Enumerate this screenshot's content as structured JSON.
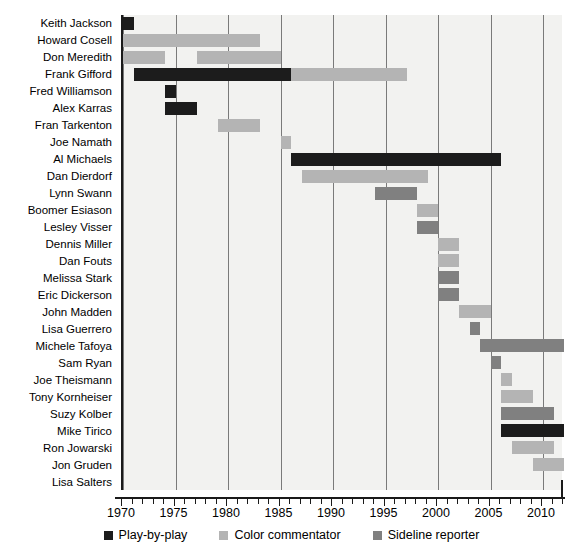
{
  "chart_data": {
    "type": "bar",
    "subtype": "gantt",
    "title": "",
    "xlabel": "",
    "ylabel": "",
    "xlim": [
      1970,
      1972
    ],
    "x_axis_range": [
      1970,
      2012
    ],
    "xticks": [
      1970,
      1975,
      1980,
      1985,
      1990,
      1995,
      2000,
      2005,
      2010
    ],
    "xtick_labels": [
      "1970",
      "1975",
      "1980",
      "1985",
      "1990",
      "1995",
      "2000",
      "2005",
      "2010"
    ],
    "minor_tick_step": 1,
    "grid": true,
    "grid_axis": "x",
    "legend_position": "bottom",
    "colors": {
      "play-by-play": "#1c1c1c",
      "color-commentator": "#b4b4b4",
      "sideline-reporter": "#808080",
      "plot_background": "#f2f2f0",
      "gridline": "#7a7a7a",
      "axis": "#1a1a1a"
    },
    "legend": [
      {
        "key": "play",
        "label": "Play-by-play",
        "color": "#1c1c1c"
      },
      {
        "key": "color",
        "label": "Color commentator",
        "color": "#b4b4b4"
      },
      {
        "key": "sideline",
        "label": "Sideline reporter",
        "color": "#808080"
      }
    ],
    "categories": [
      "Keith Jackson",
      "Howard Cosell",
      "Don Meredith",
      "Frank Gifford",
      "Fred Williamson",
      "Alex Karras",
      "Fran Tarkenton",
      "Joe Namath",
      "Al Michaels",
      "Dan Dierdorf",
      "Lynn Swann",
      "Boomer Esiason",
      "Lesley Visser",
      "Dennis Miller",
      "Dan Fouts",
      "Melissa Stark",
      "Eric Dickerson",
      "John Madden",
      "Lisa Guerrero",
      "Michele Tafoya",
      "Sam Ryan",
      "Joe Theismann",
      "Tony Kornheiser",
      "Suzy Kolber",
      "Mike Tirico",
      "Ron Jowarski",
      "Jon Gruden",
      "Lisa Salters"
    ],
    "rows": [
      {
        "name": "Keith Jackson",
        "bars": [
          {
            "role": "play",
            "start": 1970.0,
            "end": 1971.0
          }
        ]
      },
      {
        "name": "Howard Cosell",
        "bars": [
          {
            "role": "color",
            "start": 1970.0,
            "end": 1983.0
          }
        ]
      },
      {
        "name": "Don Meredith",
        "bars": [
          {
            "role": "color",
            "start": 1970.0,
            "end": 1974.0
          },
          {
            "role": "color",
            "start": 1977.0,
            "end": 1985.0
          }
        ]
      },
      {
        "name": "Frank Gifford",
        "bars": [
          {
            "role": "play",
            "start": 1971.0,
            "end": 1986.0
          },
          {
            "role": "color",
            "start": 1986.0,
            "end": 1997.0
          }
        ]
      },
      {
        "name": "Fred Williamson",
        "bars": [
          {
            "role": "play",
            "start": 1974.0,
            "end": 1975.0
          }
        ]
      },
      {
        "name": "Alex Karras",
        "bars": [
          {
            "role": "play",
            "start": 1974.0,
            "end": 1977.0
          }
        ]
      },
      {
        "name": "Fran Tarkenton",
        "bars": [
          {
            "role": "color",
            "start": 1979.0,
            "end": 1983.0
          }
        ]
      },
      {
        "name": "Joe Namath",
        "bars": [
          {
            "role": "color",
            "start": 1985.0,
            "end": 1986.0
          }
        ]
      },
      {
        "name": "Al Michaels",
        "bars": [
          {
            "role": "play",
            "start": 1986.0,
            "end": 2006.0
          }
        ]
      },
      {
        "name": "Dan Dierdorf",
        "bars": [
          {
            "role": "color",
            "start": 1987.0,
            "end": 1999.0
          }
        ]
      },
      {
        "name": "Lynn Swann",
        "bars": [
          {
            "role": "sideline",
            "start": 1994.0,
            "end": 1998.0
          }
        ]
      },
      {
        "name": "Boomer Esiason",
        "bars": [
          {
            "role": "color",
            "start": 1998.0,
            "end": 2000.0
          }
        ]
      },
      {
        "name": "Lesley Visser",
        "bars": [
          {
            "role": "sideline",
            "start": 1998.0,
            "end": 2000.0
          }
        ]
      },
      {
        "name": "Dennis Miller",
        "bars": [
          {
            "role": "color",
            "start": 2000.0,
            "end": 2002.0
          }
        ]
      },
      {
        "name": "Dan Fouts",
        "bars": [
          {
            "role": "color",
            "start": 2000.0,
            "end": 2002.0
          }
        ]
      },
      {
        "name": "Melissa Stark",
        "bars": [
          {
            "role": "sideline",
            "start": 2000.0,
            "end": 2002.0
          }
        ]
      },
      {
        "name": "Eric Dickerson",
        "bars": [
          {
            "role": "sideline",
            "start": 2000.0,
            "end": 2002.0
          }
        ]
      },
      {
        "name": "John Madden",
        "bars": [
          {
            "role": "color",
            "start": 2002.0,
            "end": 2005.0
          }
        ]
      },
      {
        "name": "Lisa Guerrero",
        "bars": [
          {
            "role": "sideline",
            "start": 2003.0,
            "end": 2004.0
          }
        ]
      },
      {
        "name": "Michele Tafoya",
        "bars": [
          {
            "role": "sideline",
            "start": 2004.0,
            "end": 2012.0
          }
        ]
      },
      {
        "name": "Sam Ryan",
        "bars": [
          {
            "role": "sideline",
            "start": 2005.0,
            "end": 2006.0
          }
        ]
      },
      {
        "name": "Joe Theismann",
        "bars": [
          {
            "role": "color",
            "start": 2006.0,
            "end": 2007.0
          }
        ]
      },
      {
        "name": "Tony Kornheiser",
        "bars": [
          {
            "role": "color",
            "start": 2006.0,
            "end": 2009.0
          }
        ]
      },
      {
        "name": "Suzy Kolber",
        "bars": [
          {
            "role": "sideline",
            "start": 2006.0,
            "end": 2011.0
          }
        ]
      },
      {
        "name": "Mike Tirico",
        "bars": [
          {
            "role": "play",
            "start": 2006.0,
            "end": 2012.0
          }
        ]
      },
      {
        "name": "Ron Jowarski",
        "bars": [
          {
            "role": "color",
            "start": 2007.0,
            "end": 2011.0
          }
        ]
      },
      {
        "name": "Jon Gruden",
        "bars": [
          {
            "role": "color",
            "start": 2009.0,
            "end": 2012.0
          }
        ]
      },
      {
        "name": "Lisa Salters",
        "bars": []
      }
    ]
  }
}
